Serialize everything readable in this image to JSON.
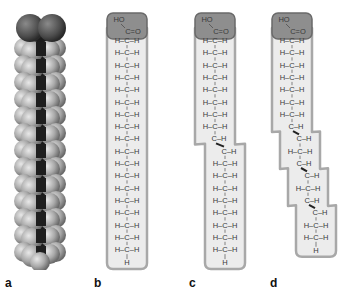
{
  "figure": {
    "panels": [
      {
        "id": "a",
        "label": "a",
        "kind": "space-filling model"
      },
      {
        "id": "b",
        "label": "b",
        "kind": "saturated fatty acid"
      },
      {
        "id": "c",
        "label": "c",
        "kind": "monounsaturated fatty acid",
        "cis_double_bonds": 1
      },
      {
        "id": "d",
        "label": "d",
        "kind": "polyunsaturated fatty acid",
        "cis_double_bonds": 3
      }
    ],
    "head_group": {
      "hydroxyl": "HO",
      "carbonyl": "C=O"
    },
    "chain_unit": "H–C–H",
    "terminal": "H",
    "colors": {
      "head_fill": "#8e8e8e",
      "head_stroke": "#6a6a6a",
      "tail_fill": "#ececec",
      "tail_stroke": "#a8a8a8",
      "text": "#3a3a3a",
      "carbon_atom": "#1e1e1e",
      "hydrogen_atom": "#b5b5b5",
      "oxygen_atom": "#555555"
    }
  }
}
